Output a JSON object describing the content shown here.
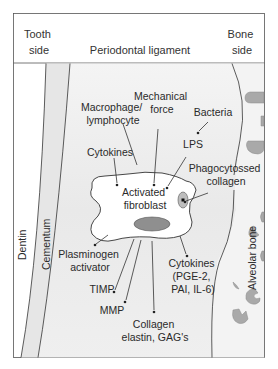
{
  "header": {
    "left": [
      "Tooth",
      "side"
    ],
    "center": "Periodontal ligament",
    "right": [
      "Bone",
      "side"
    ]
  },
  "regions": {
    "dentin": "Dentin",
    "cementum": "Cementum",
    "alveolar_bone": "Alveolar bone"
  },
  "center_cell": {
    "label": [
      "Activated",
      "fibroblast"
    ]
  },
  "inputs": [
    {
      "id": "mechanical-force",
      "lines": [
        "Mechanical",
        "force"
      ]
    },
    {
      "id": "macrophage",
      "lines": [
        "Macrophage/",
        "lymphocyte"
      ]
    },
    {
      "id": "bacteria",
      "lines": [
        "Bacteria"
      ]
    },
    {
      "id": "lps",
      "lines": [
        "LPS"
      ]
    },
    {
      "id": "cytokines-in",
      "lines": [
        "Cytokines"
      ]
    },
    {
      "id": "phagocytosed",
      "lines": [
        "Phagocytossed",
        "collagen"
      ]
    }
  ],
  "outputs": [
    {
      "id": "plasminogen",
      "lines": [
        "Plasminogen",
        "activator"
      ]
    },
    {
      "id": "timp",
      "lines": [
        "TIMP"
      ]
    },
    {
      "id": "mmp",
      "lines": [
        "MMP"
      ]
    },
    {
      "id": "collagen",
      "lines": [
        "Collagen",
        "elastin, GAG's"
      ]
    },
    {
      "id": "cytokines-out",
      "lines": [
        "Cytokines",
        "(PGE-2,",
        "PAI, IL-6)"
      ]
    }
  ],
  "colors": {
    "border": "#555555",
    "ligament_bg": "#ebebeb",
    "cementum_fill": "#e4e4e4",
    "osteoclast_fill": "#a9a9a9",
    "nucleus_fill": "#8f8f8f",
    "text": "#2a2a2a"
  }
}
